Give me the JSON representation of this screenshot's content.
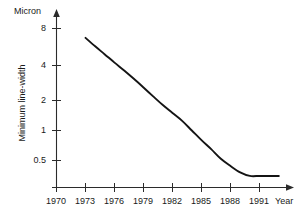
{
  "chart_data": {
    "type": "line",
    "title": "",
    "subtitle": "",
    "xlabel": "Year",
    "ylabel": "Minimum line-width",
    "yunit": "Micron",
    "yscale": "log",
    "xscale": "linear",
    "grid": false,
    "legend": false,
    "legend_position": "none",
    "xlim": [
      1970,
      1993
    ],
    "ylim": [
      0.3,
      10
    ],
    "xticks": [
      1970,
      1973,
      1976,
      1979,
      1982,
      1985,
      1988,
      1991
    ],
    "xtick_labels": [
      "1970",
      "1973",
      "1976",
      "1979",
      "1982",
      "1985",
      "1988",
      "1991"
    ],
    "yticks": [
      0.5,
      1,
      2,
      4,
      8
    ],
    "ytick_labels": [
      "0.5",
      "1",
      "2",
      "4",
      "8"
    ],
    "series": [
      {
        "name": "Minimum line-width",
        "color": "#141414",
        "x": [
          1973,
          1974,
          1975,
          1976,
          1977,
          1978,
          1979,
          1980,
          1981,
          1982,
          1983,
          1984,
          1985,
          1986,
          1987,
          1988,
          1989,
          1990,
          1991,
          1992,
          1993
        ],
        "values": [
          8.5,
          7.0,
          5.8,
          4.8,
          4.0,
          3.3,
          2.7,
          2.2,
          1.8,
          1.5,
          1.25,
          1.0,
          0.8,
          0.65,
          0.52,
          0.44,
          0.38,
          0.35,
          0.35,
          0.35,
          0.35
        ]
      }
    ],
    "annotations": [
      {
        "text": "Micron",
        "role": "y-axis-unit"
      },
      {
        "text": "Year",
        "role": "x-axis-name"
      }
    ]
  },
  "axes": {
    "y_unit_label": "Micron",
    "y_title": "Minimum line-width",
    "x_name_label": "Year"
  }
}
